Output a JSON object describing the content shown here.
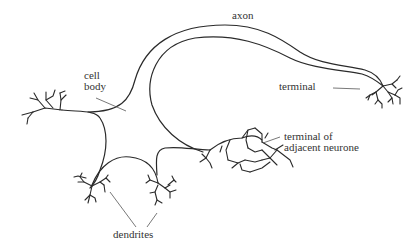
{
  "diagram": {
    "labels": {
      "axon": "axon",
      "cell_body_line1": "cell",
      "cell_body_line2": "body",
      "terminal": "terminal",
      "adjacent_line1": "terminal of",
      "adjacent_line2": "adjacent neurone",
      "dendrites": "dendrites"
    },
    "stroke_color": "#2a2a2a",
    "background": "#ffffff"
  }
}
